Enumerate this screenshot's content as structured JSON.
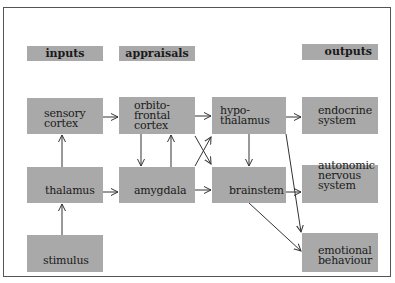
{
  "headers": {
    "inputs": "inputs",
    "appraisals": "appraisals",
    "outputs": "outputs"
  },
  "nodes": {
    "sensory_cortex": [
      "sensory",
      "cortex"
    ],
    "thalamus": [
      "thalamus"
    ],
    "stimulus": [
      "stimulus"
    ],
    "orbitofrontal_cortex": [
      "orbito-",
      "frontal",
      "cortex"
    ],
    "amygdala": [
      "amygdala"
    ],
    "hypothalamus": [
      "hypo-",
      "thalamus"
    ],
    "brainstem": [
      "brainstem"
    ],
    "endocrine_system": [
      "endocrine",
      "system"
    ],
    "autonomic_nervous_system": [
      "autonomic",
      "nervous",
      "system"
    ],
    "emotional_behaviour": [
      "emotional",
      "behaviour"
    ]
  },
  "edges": [
    [
      "stimulus",
      "thalamus"
    ],
    [
      "thalamus",
      "sensory_cortex"
    ],
    [
      "thalamus",
      "amygdala"
    ],
    [
      "sensory_cortex",
      "orbitofrontal_cortex"
    ],
    [
      "orbitofrontal_cortex",
      "amygdala"
    ],
    [
      "amygdala",
      "orbitofrontal_cortex"
    ],
    [
      "orbitofrontal_cortex",
      "hypothalamus"
    ],
    [
      "orbitofrontal_cortex",
      "brainstem"
    ],
    [
      "amygdala",
      "hypothalamus"
    ],
    [
      "amygdala",
      "brainstem"
    ],
    [
      "hypothalamus",
      "brainstem"
    ],
    [
      "hypothalamus",
      "endocrine_system"
    ],
    [
      "hypothalamus",
      "emotional_behaviour"
    ],
    [
      "brainstem",
      "autonomic_nervous_system"
    ],
    [
      "brainstem",
      "emotional_behaviour"
    ]
  ],
  "colors": {
    "box_fill": "#a9a9a9",
    "text": "#1a1a1a",
    "arrow": "#333333",
    "frame": "#555555"
  }
}
